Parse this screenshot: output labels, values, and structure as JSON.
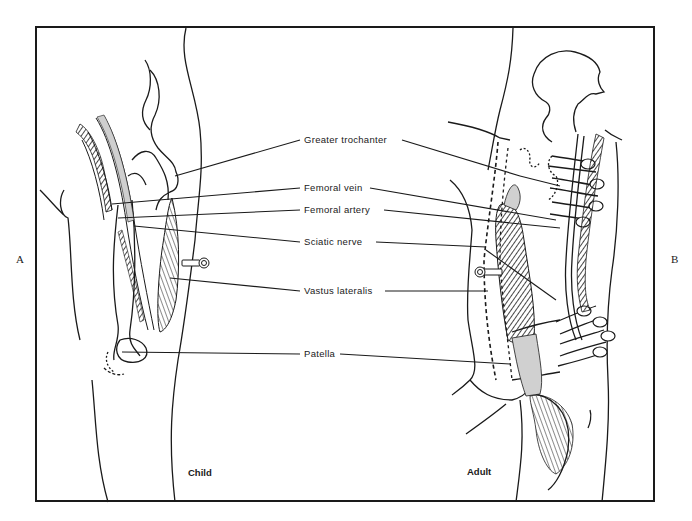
{
  "figure": {
    "panel_left_marker": "A",
    "panel_right_marker": "B",
    "panels": [
      {
        "id": "child",
        "caption": "Child"
      },
      {
        "id": "adult",
        "caption": "Adult"
      }
    ],
    "labels": [
      {
        "id": "greater-trochanter",
        "text": "Greater trochanter"
      },
      {
        "id": "femoral-vein",
        "text": "Femoral vein"
      },
      {
        "id": "femoral-artery",
        "text": "Femoral artery"
      },
      {
        "id": "sciatic-nerve",
        "text": "Sciatic nerve"
      },
      {
        "id": "vastus-lateralis",
        "text": "Vastus lateralis"
      },
      {
        "id": "patella",
        "text": "Patella"
      }
    ],
    "colors": {
      "ink": "#1a1a1a",
      "highlight_gray": "#d0d0d0",
      "background": "#ffffff"
    }
  }
}
